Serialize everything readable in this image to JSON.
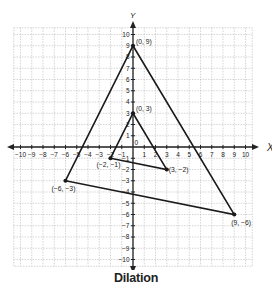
{
  "figure": {
    "caption": "Dilation",
    "x_axis_label": "X",
    "y_axis_label": "Y",
    "x_range": [
      -10,
      10
    ],
    "y_range": [
      -10,
      10
    ],
    "x_ticks": [
      "-10",
      "-9",
      "-8",
      "-7",
      "-6",
      "-5",
      "-4",
      "-3",
      "-2",
      "-1",
      "1",
      "2",
      "3",
      "4",
      "5",
      "6",
      "7",
      "8",
      "9",
      "10"
    ],
    "y_ticks": [
      "10",
      "9",
      "8",
      "7",
      "6",
      "5",
      "4",
      "3",
      "2",
      "1",
      "-1",
      "-2",
      "-3",
      "-4",
      "-5",
      "-6",
      "-7",
      "-8",
      "-9",
      "-10"
    ],
    "origin_label": "0",
    "grid": true
  },
  "shapes": {
    "original_triangle": {
      "vertices": [
        {
          "x": 0,
          "y": 3,
          "label": "(0, 3)"
        },
        {
          "x": 3,
          "y": -2,
          "label": "(3, −2)"
        },
        {
          "x": -2,
          "y": -1,
          "label": "(−2, −1)"
        }
      ]
    },
    "dilated_triangle": {
      "scale_factor": 3,
      "vertices": [
        {
          "x": 0,
          "y": 9,
          "label": "(0, 9)"
        },
        {
          "x": 9,
          "y": -6,
          "label": "(9, −6)"
        },
        {
          "x": -6,
          "y": -3,
          "label": "(−6, −3)"
        }
      ]
    }
  },
  "colors": {
    "grid": "#b8b8b8",
    "axis": "#222222",
    "shape": "#1a1a1a",
    "text": "#222222"
  }
}
